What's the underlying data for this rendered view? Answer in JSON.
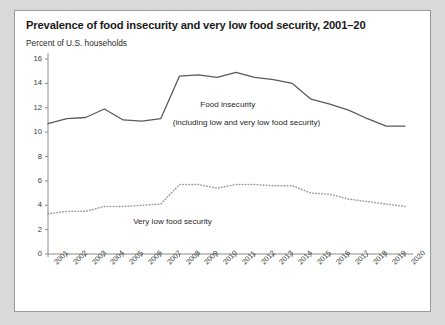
{
  "figure": {
    "title": "Prevalence of food insecurity and very low food security, 2001–20",
    "subtitle": "Percent of U.S. households"
  },
  "annotations": {
    "series1_line1": "Food insecurity",
    "series1_line2": "(including low and very low food security)",
    "series2": "Very low food security"
  },
  "colors": {
    "line": "#5a5a5a",
    "dotted": "#9b9b9b",
    "axis": "#8c8c8c",
    "text": "#1f1f1f",
    "card_background": "#ffffff",
    "page_background": "#d9d9d9",
    "card_border": "#9a9a9a"
  },
  "chart_data": {
    "type": "line",
    "title": "Prevalence of food insecurity and very low food security, 2001–20",
    "xlabel": "",
    "ylabel": "Percent of U.S. households",
    "ylim": [
      0,
      16
    ],
    "yticks": [
      0,
      2,
      4,
      6,
      8,
      10,
      12,
      14,
      16
    ],
    "ytick_labels": [
      "0",
      "2",
      "4",
      "6",
      "8",
      "10",
      "12",
      "14",
      "16"
    ],
    "grid": false,
    "legend_position": "inline-annotation",
    "categories": [
      "2001",
      "2002",
      "2003",
      "2004",
      "2005",
      "2006",
      "2007",
      "2008",
      "2009",
      "2010",
      "2011",
      "2012",
      "2013",
      "2014",
      "2015",
      "2016",
      "2017",
      "2018",
      "2019",
      "2020"
    ],
    "series": [
      {
        "name": "Food insecurity (including low and very low food security)",
        "style": "solid",
        "values": [
          10.7,
          11.1,
          11.2,
          11.9,
          11.0,
          10.9,
          11.1,
          14.6,
          14.7,
          14.5,
          14.9,
          14.5,
          14.3,
          14.0,
          12.7,
          12.3,
          11.8,
          11.1,
          10.5,
          10.5
        ]
      },
      {
        "name": "Very low food security",
        "style": "dotted",
        "values": [
          3.3,
          3.5,
          3.5,
          3.9,
          3.9,
          4.0,
          4.1,
          5.7,
          5.7,
          5.4,
          5.7,
          5.7,
          5.6,
          5.6,
          5.0,
          4.9,
          4.5,
          4.3,
          4.1,
          3.9
        ]
      }
    ]
  }
}
